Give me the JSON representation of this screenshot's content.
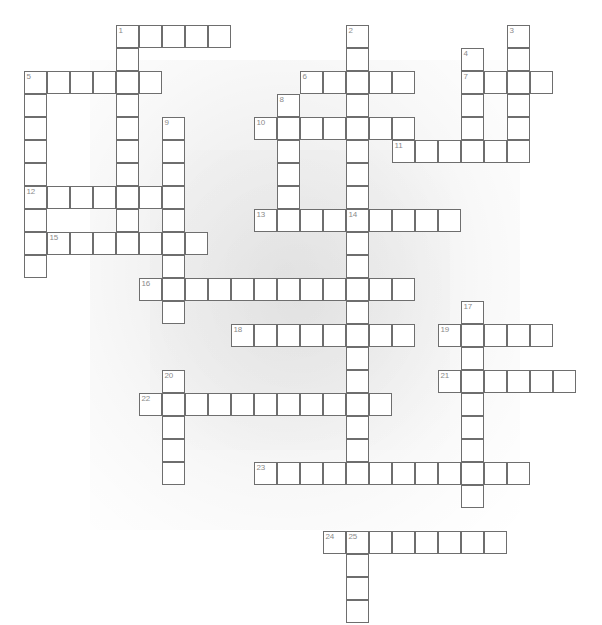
{
  "page": {
    "background_color": "#ffffff",
    "cell_border_color": "#6e6e6e",
    "cell_fill_color": "#ffffff",
    "number_color": "#8a8a8a",
    "width": 602,
    "height": 625
  },
  "grid": {
    "cell_size": 23,
    "origin_x": 24,
    "origin_y": 25,
    "columns": 25,
    "rows": 26
  },
  "entries": [
    {
      "number": "1",
      "direction": "across",
      "col": 4,
      "row": 0,
      "length": 5
    },
    {
      "number": "1",
      "direction": "down",
      "col": 4,
      "row": 0,
      "length": 9
    },
    {
      "number": "2",
      "direction": "down",
      "col": 14,
      "row": 0,
      "length": 10
    },
    {
      "number": "3",
      "direction": "down",
      "col": 21,
      "row": 0,
      "length": 5
    },
    {
      "number": "4",
      "direction": "down",
      "col": 19,
      "row": 1,
      "length": 5
    },
    {
      "number": "5",
      "direction": "across",
      "col": 0,
      "row": 2,
      "length": 6
    },
    {
      "number": "5",
      "direction": "down",
      "col": 0,
      "row": 2,
      "length": 9
    },
    {
      "number": "6",
      "direction": "across",
      "col": 12,
      "row": 2,
      "length": 5
    },
    {
      "number": "7",
      "direction": "across",
      "col": 19,
      "row": 2,
      "length": 4
    },
    {
      "number": "8",
      "direction": "down",
      "col": 11,
      "row": 3,
      "length": 6
    },
    {
      "number": "9",
      "direction": "down",
      "col": 6,
      "row": 4,
      "length": 9
    },
    {
      "number": "10",
      "direction": "across",
      "col": 10,
      "row": 4,
      "length": 7
    },
    {
      "number": "11",
      "direction": "across",
      "col": 16,
      "row": 5,
      "length": 6
    },
    {
      "number": "12",
      "direction": "across",
      "col": 0,
      "row": 7,
      "length": 6
    },
    {
      "number": "13",
      "direction": "across",
      "col": 10,
      "row": 8,
      "length": 9
    },
    {
      "number": "14",
      "direction": "down",
      "col": 14,
      "row": 8,
      "length": 11
    },
    {
      "number": "15",
      "direction": "across",
      "col": 1,
      "row": 9,
      "length": 7
    },
    {
      "number": "16",
      "direction": "across",
      "col": 5,
      "row": 11,
      "length": 12
    },
    {
      "number": "17",
      "direction": "down",
      "col": 19,
      "row": 12,
      "length": 9
    },
    {
      "number": "18",
      "direction": "across",
      "col": 9,
      "row": 13,
      "length": 8
    },
    {
      "number": "19",
      "direction": "across",
      "col": 18,
      "row": 13,
      "length": 5
    },
    {
      "number": "20",
      "direction": "down",
      "col": 6,
      "row": 15,
      "length": 5
    },
    {
      "number": "21",
      "direction": "across",
      "col": 18,
      "row": 15,
      "length": 6
    },
    {
      "number": "22",
      "direction": "across",
      "col": 5,
      "row": 16,
      "length": 11
    },
    {
      "number": "23",
      "direction": "across",
      "col": 10,
      "row": 19,
      "length": 12
    },
    {
      "number": "24",
      "direction": "across",
      "col": 13,
      "row": 22,
      "length": 8
    },
    {
      "number": "25",
      "direction": "down",
      "col": 14,
      "row": 22,
      "length": 4
    }
  ]
}
